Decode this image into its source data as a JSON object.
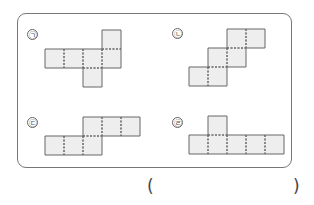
{
  "nets": [
    {
      "label": "㉠",
      "cells": [
        [
          0,
          1
        ],
        [
          1,
          1
        ],
        [
          2,
          1
        ],
        [
          3,
          1
        ],
        [
          3,
          0
        ],
        [
          2,
          2
        ]
      ]
    },
    {
      "label": "㉡",
      "cells": [
        [
          2,
          0
        ],
        [
          3,
          0
        ],
        [
          1,
          1
        ],
        [
          2,
          1
        ],
        [
          0,
          2
        ],
        [
          1,
          2
        ]
      ]
    },
    {
      "label": "㉢",
      "cells": [
        [
          2,
          0
        ],
        [
          3,
          0
        ],
        [
          4,
          0
        ],
        [
          0,
          1
        ],
        [
          1,
          1
        ],
        [
          2,
          1
        ]
      ]
    },
    {
      "label": "㉣",
      "cells": [
        [
          1,
          0
        ],
        [
          0,
          1
        ],
        [
          1,
          1
        ],
        [
          2,
          1
        ],
        [
          3,
          1
        ],
        [
          4,
          1
        ]
      ]
    }
  ],
  "answer": {
    "open": "(",
    "close": ")",
    "value": ""
  },
  "colors": {
    "fill": "#eeeeee",
    "stroke": "#666666"
  }
}
